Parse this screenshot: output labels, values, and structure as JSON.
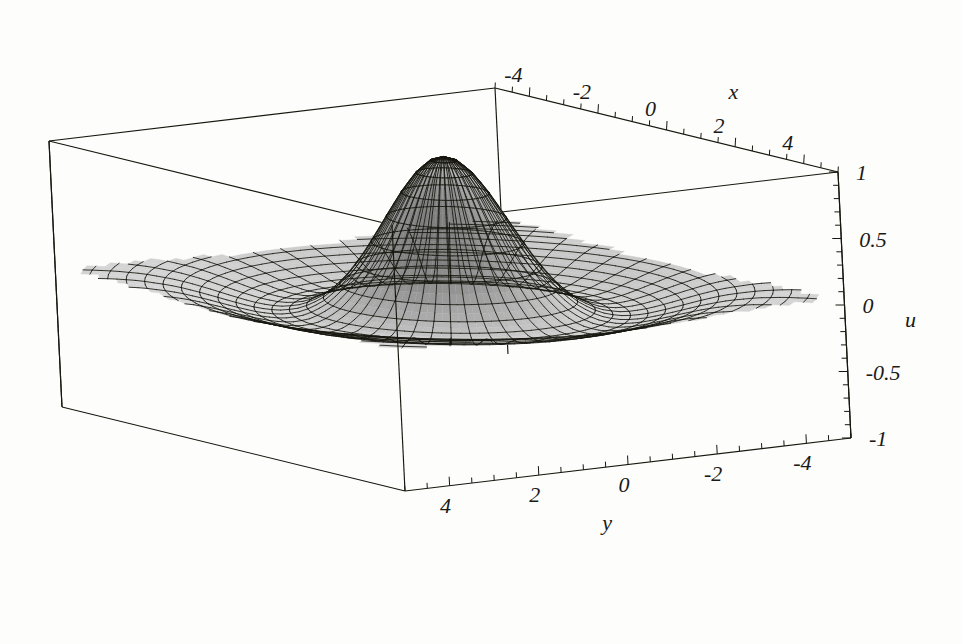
{
  "figure": {
    "kind": "3d-surface-plot",
    "style": "mathematica-mesh-grayscale",
    "background_color": "#fdfdfb",
    "line_color": "#17170f",
    "surface_light_color": "#d7d7d7",
    "surface_mid_color": "#a8a8a8",
    "surface_dark_color": "#4a4a4a",
    "peak_color": "#111111"
  },
  "axes": {
    "x": {
      "label": "x",
      "ticks": [
        "-4",
        "-2",
        "0",
        "2",
        "4"
      ],
      "tick_values": [
        -4,
        -2,
        0,
        2,
        4
      ],
      "range": [
        -5,
        5
      ],
      "position": "top-back-edge"
    },
    "y": {
      "label": "y",
      "ticks": [
        "-4",
        "-2",
        "0",
        "2",
        "4"
      ],
      "tick_values": [
        -4,
        -2,
        0,
        2,
        4
      ],
      "range": [
        -5,
        5
      ],
      "position": "bottom-front-edge"
    },
    "u": {
      "label": "u",
      "ticks": [
        "1",
        "0.5",
        "0",
        "-0.5",
        "-1"
      ],
      "tick_values": [
        1,
        0.5,
        0,
        -0.5,
        -1
      ],
      "range": [
        -1,
        1
      ],
      "position": "right-vertical-edge"
    }
  },
  "chart_data": {
    "type": "surface",
    "title": "",
    "xlabel": "x",
    "ylabel": "y",
    "zlabel": "u",
    "xlim": [
      -5,
      5
    ],
    "ylim": [
      -5,
      5
    ],
    "zlim": [
      -1,
      1
    ],
    "grid": true,
    "legend": false,
    "surface_form": "u(x,y) = sinc-like radial profile of r = sqrt(x^2 + y^2)",
    "radial_profile": {
      "r": [
        0.0,
        0.25,
        0.5,
        0.75,
        1.0,
        1.25,
        1.5,
        1.75,
        2.0,
        2.25,
        2.5,
        2.75,
        3.0,
        3.25,
        3.5,
        3.75,
        4.0,
        4.25,
        4.5,
        4.75,
        5.0,
        5.5,
        6.0,
        6.5,
        7.07
      ],
      "u": [
        1.0,
        0.969,
        0.88,
        0.75,
        0.59,
        0.425,
        0.265,
        0.126,
        0.012,
        -0.072,
        -0.129,
        -0.163,
        -0.176,
        -0.172,
        -0.155,
        -0.131,
        -0.103,
        -0.074,
        -0.046,
        -0.021,
        0.0,
        0.028,
        0.04,
        0.04,
        0.03
      ]
    },
    "peak": {
      "x": 0,
      "y": 0,
      "u": 1.0
    },
    "trough": {
      "radius": 3.0,
      "u": -0.176
    },
    "mesh": {
      "radial_lines": 48,
      "circular_lines": 26
    }
  },
  "box": {
    "corners_px": {
      "top_back": [
        495,
        88
      ],
      "top_left": [
        49,
        141
      ],
      "top_right": [
        838,
        172
      ],
      "top_front": [
        392,
        236
      ],
      "bottom_left": [
        62,
        407
      ],
      "bottom_right": [
        838,
        455
      ],
      "bottom_front": [
        355,
        585
      ]
    }
  }
}
